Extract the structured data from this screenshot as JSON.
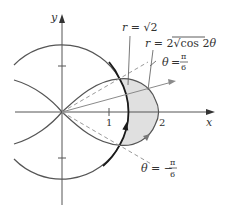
{
  "figure": {
    "type": "polar-region-diagram",
    "axes": {
      "x_label": "x",
      "y_label": "y",
      "x_ticks": [
        {
          "value": 1,
          "label": "1"
        },
        {
          "value": 2,
          "label": "2"
        }
      ],
      "y_ticks": [
        1,
        -1
      ]
    },
    "curves": [
      {
        "name": "circle",
        "equation_lhs": "r = ",
        "equation_rhs": "√2",
        "label": "r = √2"
      },
      {
        "name": "lemniscate",
        "label": "r = 2√cos 2θ",
        "lhs": "r = 2",
        "radical": "√",
        "radicand": "cos 2θ"
      }
    ],
    "rays": [
      {
        "name": "theta-pos",
        "lhs": "θ = ",
        "num": "π",
        "den": "6"
      },
      {
        "name": "theta-neg",
        "lhs": "θ = −",
        "num": "π",
        "den": "6"
      }
    ],
    "colors": {
      "axis": "#555555",
      "curve": "#555555",
      "circle": "#1a1a1a",
      "shade": "#e0e0e0",
      "dashed": "#9a9a9a",
      "arrow": "#8a8a8a"
    }
  }
}
